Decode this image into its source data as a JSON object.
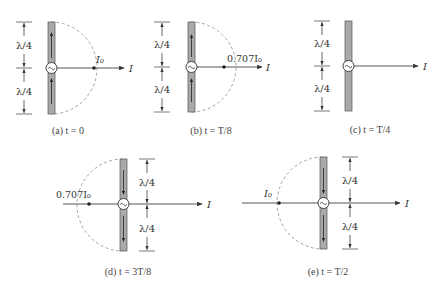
{
  "figure": {
    "dimension_label": "λ/4",
    "axis_label": "I",
    "colors": {
      "bar_fill": "#a9a9a9",
      "bar_stroke": "#555555",
      "line": "#444444",
      "dashed": "#9a9a9a",
      "text": "#333333"
    },
    "panels": [
      {
        "id": "a",
        "caption_prefix": "(a)",
        "caption_var": "t",
        "caption_eq": "= 0",
        "value_label": "I₀",
        "value_fraction": 1.0,
        "current_direction": "up",
        "bar": {
          "x": 48,
          "top": 22,
          "bottom": 114,
          "cy": 68
        },
        "dim_x": 24,
        "side": "right"
      },
      {
        "id": "b",
        "caption_prefix": "(b)",
        "caption_var": "t",
        "caption_eq": "= T/8",
        "value_label": "0.707I₀",
        "value_fraction": 0.707,
        "current_direction": "up",
        "bar": {
          "x": 188,
          "top": 22,
          "bottom": 112,
          "cy": 67
        },
        "dim_x": 162,
        "side": "right"
      },
      {
        "id": "c",
        "caption_prefix": "(c)",
        "caption_var": "t",
        "caption_eq": "= T/4",
        "value_label": "",
        "value_fraction": 0,
        "current_direction": "none",
        "bar": {
          "x": 345,
          "top": 21,
          "bottom": 111,
          "cy": 66
        },
        "dim_x": 322,
        "side": "right"
      },
      {
        "id": "d",
        "caption_prefix": "(d)",
        "caption_var": "t",
        "caption_eq": "= 3T/8",
        "value_label": "0.707I₀",
        "value_fraction": -0.707,
        "current_direction": "down",
        "bar": {
          "x": 120,
          "top": 159,
          "bottom": 251,
          "cy": 204
        },
        "dim_x": 147,
        "side": "left"
      },
      {
        "id": "e",
        "caption_prefix": "(e)",
        "caption_var": "t",
        "caption_eq": "= T/2",
        "value_label": "I₀",
        "value_fraction": -1.0,
        "current_direction": "down",
        "bar": {
          "x": 320,
          "top": 157,
          "bottom": 249,
          "cy": 203
        },
        "dim_x": 350,
        "side": "left"
      }
    ],
    "captions": {
      "a": "(a)  t = 0",
      "b": "(b)  t = T/8",
      "c": "(c)  t = T/4",
      "d": "(d)  t = 3T/8",
      "e": "(e)  t = T/2"
    }
  }
}
